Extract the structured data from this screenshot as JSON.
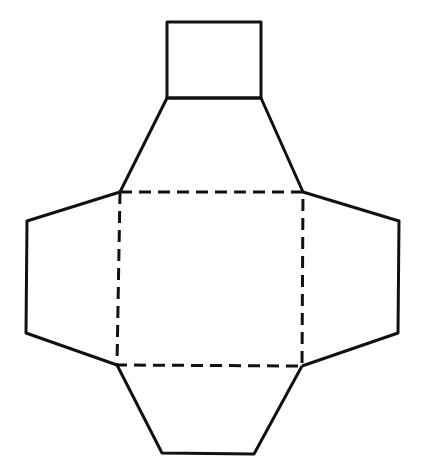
{
  "diagram": {
    "stroke_color": "#111111",
    "background": "#ffffff",
    "top_square": {
      "x": 167,
      "y": 22,
      "w": 94,
      "h": 76
    },
    "base": {
      "points": "120,192 303,192 302,366 117,365",
      "style": "dashed"
    },
    "top_flap": {
      "points": "120,192 167,98 261,98 303,192"
    },
    "left_flap": {
      "points": "120,192 27,221 26,333 117,365"
    },
    "right_flap": {
      "points": "303,192 399,221 398,333 302,366"
    },
    "bottom_flap": {
      "points": "117,365 162,453 254,454 302,366"
    }
  }
}
